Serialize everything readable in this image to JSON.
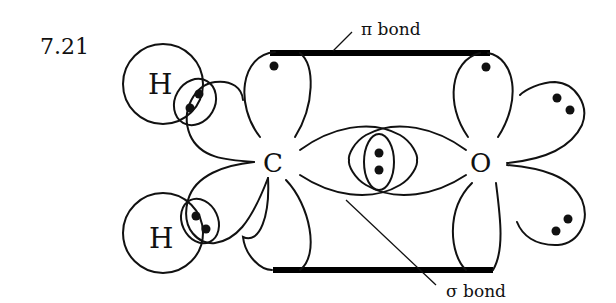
{
  "figure": {
    "number": "7.21"
  },
  "atoms": {
    "carbon": "C",
    "oxygen": "O",
    "hydrogen_top": "H",
    "hydrogen_bottom": "H"
  },
  "labels": {
    "pi_bond": "π bond",
    "sigma_bond": "σ bond"
  },
  "colors": {
    "ink": "#111111",
    "background": "#ffffff"
  }
}
